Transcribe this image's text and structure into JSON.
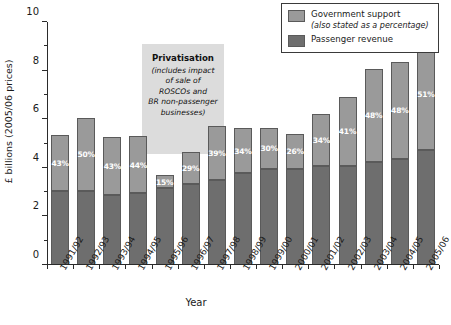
{
  "chart_data": {
    "type": "bar",
    "subtype": "stacked-bar",
    "title": "",
    "xlabel": "Year",
    "ylabel": "£ billions (2005/06 prices)",
    "ylim": [
      0,
      10
    ],
    "ytick_labels": [
      "0",
      "2",
      "4",
      "6",
      "8",
      "10"
    ],
    "ytick_values": [
      0,
      2,
      4,
      6,
      8,
      10
    ],
    "yminor_values": [
      1,
      3,
      5,
      7,
      9
    ],
    "grid": false,
    "legend_position": "top-right",
    "categories": [
      "1991/92",
      "1992/93",
      "1993/94",
      "1994/95",
      "1995/96",
      "1996/97",
      "1997/98",
      "1998/99",
      "1999/00",
      "2000/01",
      "2001/02",
      "2002/03",
      "2003/04",
      "2004/05",
      "2005/06"
    ],
    "series": [
      {
        "name": "Passenger revenue",
        "color": "#6e6e6e",
        "values": [
          3.05,
          3.05,
          2.9,
          2.95,
          3.15,
          3.32,
          3.5,
          3.78,
          3.95,
          3.95,
          4.07,
          4.08,
          4.25,
          4.37,
          4.73
        ]
      },
      {
        "name": "Government support",
        "color": "#9a9a9a",
        "values": [
          2.3,
          3.02,
          2.37,
          2.35,
          0.55,
          1.33,
          2.22,
          1.85,
          1.7,
          1.45,
          2.13,
          2.84,
          3.83,
          3.98,
          4.6
        ]
      }
    ],
    "totals": [
      5.35,
      6.07,
      5.27,
      5.3,
      3.7,
      4.65,
      5.72,
      5.63,
      5.65,
      5.4,
      6.2,
      6.92,
      8.08,
      8.35,
      9.33
    ],
    "data_labels": [
      "43%",
      "50%",
      "43%",
      "44%",
      "15%",
      "29%",
      "39%",
      "34%",
      "30%",
      "26%",
      "34%",
      "41%",
      "48%",
      "48%",
      "51%"
    ],
    "data_label_note": "Percentage shown is the government support share of the total"
  },
  "legend": {
    "items": [
      {
        "label": "Government support",
        "sublabel": "(also stated as a percentage)",
        "color": "#9a9a9a"
      },
      {
        "label": "Passenger revenue",
        "sublabel": "",
        "color": "#6e6e6e"
      }
    ]
  },
  "annotation": {
    "title": "Privatisation",
    "lines": [
      "(includes impact",
      "of sale of",
      "ROSCOs and",
      "BR non-passenger",
      "businesses)"
    ]
  },
  "colors": {
    "support": "#9a9a9a",
    "revenue": "#6e6e6e",
    "annotation_bg": "#dcdcdc",
    "axis": "#2b2b2b",
    "label_text": "#ffffff"
  }
}
